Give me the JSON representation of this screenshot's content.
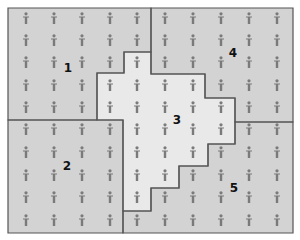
{
  "diagram": {
    "type": "zoned-population-map",
    "colors": {
      "background": "#ffffff",
      "region_fill": "#d3d3d3",
      "center_region_fill": "#e9e9e9",
      "border": "#555555",
      "icon": "#7a7a7a",
      "label": "#111111"
    },
    "icon_semantic": "person-icon",
    "icon_grid": {
      "columns_x": [
        26,
        54,
        82,
        110,
        137,
        165,
        193,
        221,
        249,
        277
      ],
      "rows_y": [
        18,
        40,
        62,
        85,
        107,
        129,
        152,
        175,
        197,
        220
      ]
    },
    "regions": [
      {
        "id": "1",
        "label": "1",
        "label_pos": [
          68,
          72
        ],
        "fill": "region_fill",
        "points": "8,8 151,8 151,52 124,52 124,73 97,73 97,120 8,120"
      },
      {
        "id": "2",
        "label": "2",
        "label_pos": [
          67,
          170
        ],
        "fill": "region_fill",
        "points": "8,120 123,120 123,233 8,233"
      },
      {
        "id": "3",
        "label": "3",
        "label_pos": [
          177,
          124
        ],
        "fill": "center_region_fill",
        "points": "97,73 124,73 124,52 151,52 151,74 205,74 205,98 235,98 235,144 208,144 208,166 179,166 179,188 151,188 151,211 123,211 123,120 97,120"
      },
      {
        "id": "4",
        "label": "4",
        "label_pos": [
          233,
          57
        ],
        "fill": "region_fill",
        "points": "151,8 293,8 293,122 235,122 235,98 205,98 205,74 151,74"
      },
      {
        "id": "5",
        "label": "5",
        "label_pos": [
          234,
          192
        ],
        "fill": "region_fill",
        "points": "235,122 293,122 293,233 123,233 123,211 151,211 151,188 179,188 179,166 208,166 208,144 235,144"
      }
    ]
  }
}
